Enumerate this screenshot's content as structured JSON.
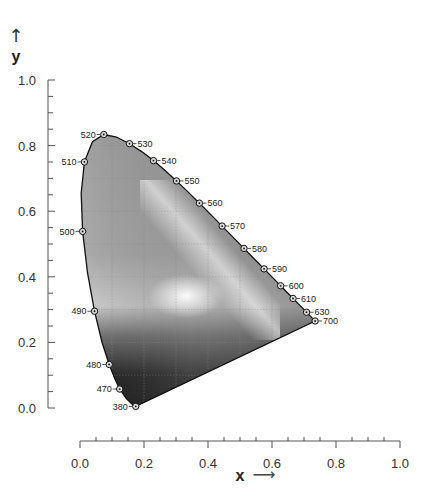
{
  "chart_data": {
    "type": "scatter",
    "title": "",
    "subtitle": "CIE 1931 chromaticity diagram (spectral locus)",
    "xlabel": "x",
    "ylabel": "y",
    "xlim": [
      0.0,
      1.0
    ],
    "ylim": [
      0.0,
      1.0
    ],
    "x_ticks": [
      "0.0",
      "0.2",
      "0.4",
      "0.6",
      "0.8",
      "1.0"
    ],
    "y_ticks": [
      "0.0",
      "0.2",
      "0.4",
      "0.6",
      "0.8",
      "1.0"
    ],
    "grid": true,
    "legend": null,
    "series": [
      {
        "name": "spectral locus (labeled wavelengths, nm)",
        "points": [
          {
            "label": "380",
            "x": 0.1741,
            "y": 0.005
          },
          {
            "label": "470",
            "x": 0.1241,
            "y": 0.0578
          },
          {
            "label": "480",
            "x": 0.0913,
            "y": 0.1327
          },
          {
            "label": "490",
            "x": 0.0454,
            "y": 0.295
          },
          {
            "label": "500",
            "x": 0.0082,
            "y": 0.5384
          },
          {
            "label": "510",
            "x": 0.0139,
            "y": 0.7502
          },
          {
            "label": "520",
            "x": 0.0743,
            "y": 0.8338
          },
          {
            "label": "530",
            "x": 0.1547,
            "y": 0.8059
          },
          {
            "label": "540",
            "x": 0.2296,
            "y": 0.7543
          },
          {
            "label": "550",
            "x": 0.3016,
            "y": 0.6923
          },
          {
            "label": "560",
            "x": 0.3731,
            "y": 0.6245
          },
          {
            "label": "570",
            "x": 0.4441,
            "y": 0.5547
          },
          {
            "label": "580",
            "x": 0.5125,
            "y": 0.4866
          },
          {
            "label": "590",
            "x": 0.5752,
            "y": 0.4242
          },
          {
            "label": "600",
            "x": 0.627,
            "y": 0.3725
          },
          {
            "label": "610",
            "x": 0.6658,
            "y": 0.334
          },
          {
            "label": "630",
            "x": 0.7079,
            "y": 0.292
          },
          {
            "label": "700",
            "x": 0.7347,
            "y": 0.2653
          }
        ]
      }
    ],
    "annotations": [
      "x →",
      "↑ y"
    ]
  },
  "locus_curve": [
    [
      0.1741,
      0.005
    ],
    [
      0.1738,
      0.0049
    ],
    [
      0.1733,
      0.0048
    ],
    [
      0.1726,
      0.0048
    ],
    [
      0.1714,
      0.0051
    ],
    [
      0.1689,
      0.0069
    ],
    [
      0.1644,
      0.0109
    ],
    [
      0.1566,
      0.0177
    ],
    [
      0.144,
      0.0297
    ],
    [
      0.1241,
      0.0578
    ],
    [
      0.1096,
      0.0868
    ],
    [
      0.0913,
      0.1327
    ],
    [
      0.0687,
      0.2007
    ],
    [
      0.0454,
      0.295
    ],
    [
      0.0235,
      0.4127
    ],
    [
      0.0082,
      0.5384
    ],
    [
      0.0039,
      0.6548
    ],
    [
      0.0139,
      0.7502
    ],
    [
      0.0389,
      0.812
    ],
    [
      0.0743,
      0.8338
    ],
    [
      0.1142,
      0.8262
    ],
    [
      0.1547,
      0.8059
    ],
    [
      0.1929,
      0.7816
    ],
    [
      0.2296,
      0.7543
    ],
    [
      0.2658,
      0.7243
    ],
    [
      0.3016,
      0.6923
    ],
    [
      0.3373,
      0.6589
    ],
    [
      0.3731,
      0.6245
    ],
    [
      0.4087,
      0.5896
    ],
    [
      0.4441,
      0.5547
    ],
    [
      0.4788,
      0.5202
    ],
    [
      0.5125,
      0.4866
    ],
    [
      0.5448,
      0.4544
    ],
    [
      0.5752,
      0.4242
    ],
    [
      0.6029,
      0.3965
    ],
    [
      0.627,
      0.3725
    ],
    [
      0.6482,
      0.3514
    ],
    [
      0.6658,
      0.334
    ],
    [
      0.6801,
      0.3197
    ],
    [
      0.6915,
      0.3083
    ],
    [
      0.7006,
      0.2993
    ],
    [
      0.7079,
      0.292
    ],
    [
      0.714,
      0.2859
    ],
    [
      0.719,
      0.2809
    ],
    [
      0.723,
      0.277
    ],
    [
      0.726,
      0.274
    ],
    [
      0.7283,
      0.2717
    ],
    [
      0.73,
      0.27
    ],
    [
      0.732,
      0.268
    ],
    [
      0.7347,
      0.2653
    ]
  ],
  "labels": {
    "x_axis_title": "x",
    "x_axis_arrow": "⟶",
    "y_axis_title": "y",
    "y_axis_arrow": "↑"
  },
  "colors": {
    "locus_stroke": "#111111",
    "axis": "#555555",
    "grid": "#8a8a8a",
    "fill_light": "#e8e8e8",
    "fill_mid": "#a8a8a8",
    "fill_dark": "#1c1c1c"
  }
}
